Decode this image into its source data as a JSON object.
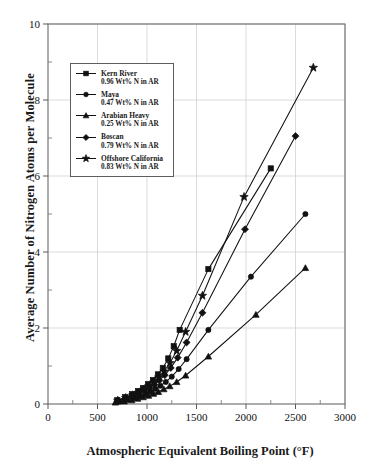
{
  "chart_data": {
    "type": "line",
    "title": "",
    "xlabel": "Atmospheric Equivalent Boiling Point  (°F)",
    "ylabel": "Average Number of Nitrogen Atoms per Molecule",
    "xlim": [
      0,
      3000
    ],
    "ylim": [
      0,
      10
    ],
    "xticks": [
      0,
      500,
      1000,
      1500,
      2000,
      2500,
      3000
    ],
    "yticks": [
      0,
      2,
      4,
      6,
      8,
      10
    ],
    "xminor_step": 250,
    "yminor_step": 1,
    "grid": true,
    "legend_position": "upper-left",
    "series": [
      {
        "name": "Kern River",
        "sublabel": "0.96 Wt% N in AR",
        "marker": "square",
        "points": [
          [
            700,
            0.1
          ],
          [
            780,
            0.18
          ],
          [
            850,
            0.26
          ],
          [
            910,
            0.34
          ],
          [
            960,
            0.42
          ],
          [
            1010,
            0.52
          ],
          [
            1060,
            0.63
          ],
          [
            1110,
            0.78
          ],
          [
            1160,
            0.95
          ],
          [
            1215,
            1.2
          ],
          [
            1270,
            1.52
          ],
          [
            1330,
            1.95
          ],
          [
            1620,
            3.55
          ],
          [
            2250,
            6.2
          ]
        ]
      },
      {
        "name": "Maya",
        "sublabel": "0.47 Wt% N in AR",
        "marker": "circle",
        "points": [
          [
            720,
            0.06
          ],
          [
            800,
            0.11
          ],
          [
            870,
            0.16
          ],
          [
            930,
            0.21
          ],
          [
            985,
            0.27
          ],
          [
            1035,
            0.33
          ],
          [
            1085,
            0.4
          ],
          [
            1135,
            0.48
          ],
          [
            1190,
            0.58
          ],
          [
            1250,
            0.72
          ],
          [
            1320,
            0.92
          ],
          [
            1400,
            1.18
          ],
          [
            1620,
            1.95
          ],
          [
            2050,
            3.35
          ],
          [
            2600,
            5.0
          ]
        ]
      },
      {
        "name": "Arabian Heavy",
        "sublabel": "0.25 Wt% N in AR",
        "marker": "triangle",
        "points": [
          [
            680,
            0.04
          ],
          [
            770,
            0.07
          ],
          [
            845,
            0.1
          ],
          [
            905,
            0.14
          ],
          [
            960,
            0.18
          ],
          [
            1015,
            0.22
          ],
          [
            1065,
            0.27
          ],
          [
            1115,
            0.32
          ],
          [
            1170,
            0.39
          ],
          [
            1230,
            0.47
          ],
          [
            1300,
            0.58
          ],
          [
            1390,
            0.75
          ],
          [
            1620,
            1.25
          ],
          [
            2100,
            2.35
          ],
          [
            2600,
            3.58
          ]
        ]
      },
      {
        "name": "Boscan",
        "sublabel": "0.79 Wt% N in AR",
        "marker": "diamond",
        "points": [
          [
            710,
            0.08
          ],
          [
            790,
            0.14
          ],
          [
            860,
            0.2
          ],
          [
            920,
            0.27
          ],
          [
            975,
            0.34
          ],
          [
            1025,
            0.42
          ],
          [
            1075,
            0.51
          ],
          [
            1125,
            0.62
          ],
          [
            1180,
            0.76
          ],
          [
            1240,
            0.95
          ],
          [
            1310,
            1.22
          ],
          [
            1400,
            1.62
          ],
          [
            1560,
            2.4
          ],
          [
            1990,
            4.6
          ],
          [
            2500,
            7.05
          ]
        ]
      },
      {
        "name": "Offshore California",
        "sublabel": "0.83 Wt% N in AR",
        "marker": "star",
        "points": [
          [
            705,
            0.09
          ],
          [
            785,
            0.16
          ],
          [
            855,
            0.23
          ],
          [
            915,
            0.3
          ],
          [
            968,
            0.38
          ],
          [
            1018,
            0.47
          ],
          [
            1068,
            0.57
          ],
          [
            1118,
            0.7
          ],
          [
            1172,
            0.86
          ],
          [
            1232,
            1.08
          ],
          [
            1300,
            1.4
          ],
          [
            1390,
            1.9
          ],
          [
            1560,
            2.85
          ],
          [
            1980,
            5.45
          ],
          [
            2680,
            8.85
          ]
        ]
      }
    ]
  },
  "axes": {
    "x_title": "Atmospheric Equivalent Boiling Point  (°F)",
    "y_title": "Average Number of Nitrogen Atoms per Molecule"
  }
}
